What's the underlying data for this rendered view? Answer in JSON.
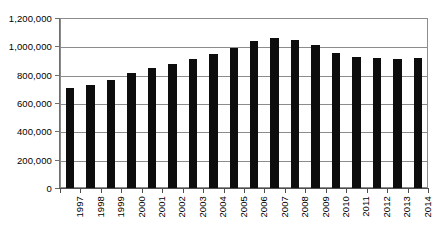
{
  "chart_data": {
    "type": "bar",
    "title": "",
    "subtitle": "",
    "xlabel": "",
    "ylabel": "",
    "categories": [
      "1997",
      "1998",
      "1999",
      "2000",
      "2001",
      "2002",
      "2003",
      "2004",
      "2005",
      "2006",
      "2007",
      "2008",
      "2009",
      "2010",
      "2011",
      "2012",
      "2013",
      "2014"
    ],
    "values": [
      705000,
      730000,
      765000,
      815000,
      850000,
      875000,
      910000,
      945000,
      990000,
      1040000,
      1060000,
      1045000,
      1010000,
      955000,
      925000,
      915000,
      910000,
      915000
    ],
    "series": [
      {
        "name": "",
        "values": [
          705000,
          730000,
          765000,
          815000,
          850000,
          875000,
          910000,
          945000,
          990000,
          1040000,
          1060000,
          1045000,
          1010000,
          955000,
          925000,
          915000,
          910000,
          915000
        ]
      }
    ],
    "ylim": [
      0,
      1200000
    ],
    "ytick_values": [
      0,
      200000,
      400000,
      600000,
      800000,
      1000000,
      1200000
    ],
    "ytick_labels": [
      "0",
      "200,000",
      "400,000",
      "600,000",
      "800,000",
      "1,000,000",
      "1,200,000"
    ],
    "grid": true,
    "grid_axis": "y",
    "legend": false,
    "legend_position": "none",
    "annotations": [],
    "bar_color": "#0d0d0d",
    "grid_color": "#8c8c8c",
    "axis_color": "#4d4d4d",
    "xtick_label_rotation": 90
  }
}
